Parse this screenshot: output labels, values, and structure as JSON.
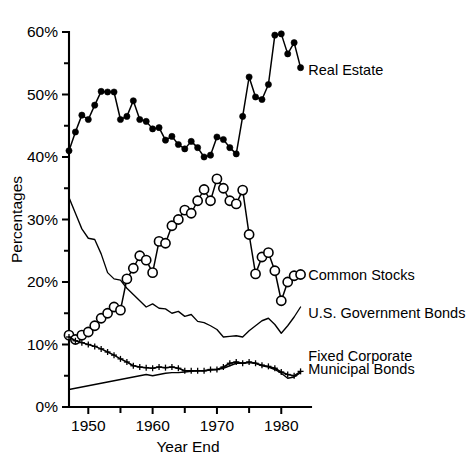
{
  "chart_data": {
    "type": "line",
    "title": "",
    "xlabel": "Year End",
    "ylabel": "Percentages",
    "xlim": [
      1947,
      1984
    ],
    "ylim": [
      0,
      60
    ],
    "grid": false,
    "legend_position": "right-inline-labels",
    "x_ticks": [
      1950,
      1955,
      1960,
      1965,
      1970,
      1975,
      1980
    ],
    "x_tick_labels": [
      "1950",
      "",
      "1960",
      "",
      "1970",
      "",
      "1980"
    ],
    "y_ticks": [
      0,
      5,
      10,
      15,
      20,
      25,
      30,
      35,
      40,
      45,
      50,
      55,
      60
    ],
    "y_tick_labels": [
      "0%",
      "",
      "10%",
      "",
      "20%",
      "",
      "30%",
      "",
      "40%",
      "",
      "50%",
      "",
      "60%"
    ],
    "x": [
      1947,
      1948,
      1949,
      1950,
      1951,
      1952,
      1953,
      1954,
      1955,
      1956,
      1957,
      1958,
      1959,
      1960,
      1961,
      1962,
      1963,
      1964,
      1965,
      1966,
      1967,
      1968,
      1969,
      1970,
      1971,
      1972,
      1973,
      1974,
      1975,
      1976,
      1977,
      1978,
      1979,
      1980,
      1981,
      1982,
      1983
    ],
    "series": [
      {
        "name": "Real Estate",
        "marker": "filled-circle",
        "values": [
          41.0,
          44.0,
          46.7,
          46.0,
          48.3,
          50.5,
          50.4,
          50.4,
          46.0,
          46.5,
          49.0,
          46.0,
          45.7,
          44.5,
          44.7,
          42.7,
          43.3,
          42.0,
          41.3,
          42.5,
          41.5,
          40.0,
          40.3,
          43.2,
          42.8,
          41.5,
          40.5,
          46.5,
          52.8,
          49.6,
          49.2,
          51.6,
          59.5,
          59.7,
          56.5,
          58.3,
          54.3
        ]
      },
      {
        "name": "Common Stocks",
        "marker": "open-circle",
        "values": [
          11.5,
          10.8,
          11.5,
          12.0,
          13.0,
          14.2,
          15.0,
          16.0,
          15.5,
          20.5,
          22.2,
          24.2,
          23.5,
          21.5,
          26.5,
          26.2,
          29.0,
          30.0,
          31.5,
          31.0,
          33.0,
          34.8,
          33.0,
          36.5,
          35.0,
          33.0,
          32.5,
          34.7,
          27.6,
          21.3,
          24.0,
          24.7,
          21.8,
          17.0,
          20.0,
          21.0,
          21.2
        ]
      },
      {
        "name": "U.S. Government Bonds",
        "marker": "none",
        "values": [
          33.5,
          31.0,
          28.5,
          27.0,
          26.8,
          24.5,
          21.5,
          20.5,
          20.3,
          19.0,
          18.0,
          17.0,
          16.0,
          16.5,
          15.8,
          15.7,
          15.0,
          15.3,
          14.5,
          14.8,
          13.7,
          13.5,
          13.0,
          12.4,
          11.2,
          11.3,
          11.4,
          11.2,
          12.2,
          13.0,
          13.8,
          14.2,
          13.2,
          11.8,
          13.0,
          14.4,
          16.0
        ]
      },
      {
        "name": "Fixed Corporate",
        "marker": "plus",
        "values": [
          11.2,
          10.6,
          10.3,
          10.0,
          9.7,
          9.3,
          8.8,
          8.3,
          7.7,
          7.2,
          6.6,
          6.4,
          6.3,
          6.2,
          6.4,
          6.3,
          6.4,
          6.2,
          5.8,
          5.8,
          5.8,
          5.8,
          6.0,
          6.0,
          6.4,
          7.0,
          7.2,
          7.0,
          7.2,
          7.0,
          6.7,
          6.5,
          6.2,
          5.6,
          5.2,
          5.0,
          5.7
        ]
      },
      {
        "name": "Municipal Bonds",
        "marker": "none",
        "values": [
          2.8,
          3.0,
          3.2,
          3.4,
          3.6,
          3.8,
          4.0,
          4.2,
          4.4,
          4.6,
          4.8,
          5.0,
          5.2,
          5.0,
          5.2,
          5.4,
          5.5,
          5.5,
          5.6,
          5.7,
          5.8,
          5.8,
          5.9,
          6.0,
          6.2,
          6.6,
          7.0,
          7.0,
          7.1,
          7.0,
          6.6,
          6.4,
          6.0,
          5.4,
          4.6,
          4.8,
          5.5
        ]
      }
    ],
    "annotations": [
      {
        "text": "Real Estate",
        "x": 1984.2,
        "y": 54.0
      },
      {
        "text": "Common Stocks",
        "x": 1984.2,
        "y": 21.2
      },
      {
        "text": "U.S. Government Bonds",
        "x": 1984.2,
        "y": 15.0
      },
      {
        "text": "Fixed Corporate",
        "x": 1984.2,
        "y": 8.2
      },
      {
        "text": "Municipal Bonds",
        "x": 1984.2,
        "y": 6.1
      }
    ],
    "colors": {
      "ink": "#000000",
      "background": "#ffffff"
    }
  }
}
